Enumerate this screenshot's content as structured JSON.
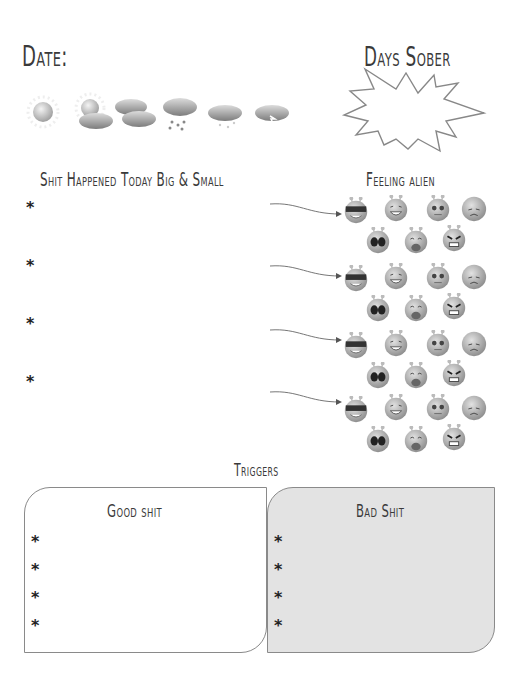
{
  "header": {
    "date_label": "Date:",
    "days_sober_label": "Days Sober",
    "days_sober_value": ""
  },
  "weather_icons": [
    {
      "name": "sun-icon",
      "x": 28
    },
    {
      "name": "partly-cloudy-icon",
      "x": 72
    },
    {
      "name": "cloudy-icon",
      "x": 112
    },
    {
      "name": "rain-icon",
      "x": 162
    },
    {
      "name": "snow-icon",
      "x": 206
    },
    {
      "name": "thunder-icon",
      "x": 252
    }
  ],
  "events": {
    "title": "Shit Happened Today Big & Small",
    "bullet": "*",
    "items": [
      "",
      "",
      "",
      ""
    ]
  },
  "feelings": {
    "title": "Feeling alien",
    "faces": [
      "cool",
      "laughing",
      "worried",
      "sad",
      "scared",
      "crying",
      "angry"
    ]
  },
  "triggers": {
    "title": "Triggers",
    "good": {
      "title": "Good shit",
      "bullet": "*",
      "items": [
        "",
        "",
        "",
        ""
      ]
    },
    "bad": {
      "title": "Bad Shit",
      "bullet": "*",
      "items": [
        "",
        "",
        "",
        ""
      ]
    }
  },
  "colors": {
    "text": "#3a3a3a",
    "box_border": "#8a8a8a",
    "bad_fill": "#e3e3e3",
    "alien_gray": "#a8a8a8"
  }
}
